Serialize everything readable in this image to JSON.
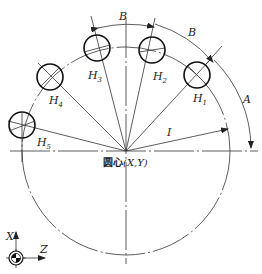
{
  "diagram": {
    "center_label_prefix": "圆心",
    "center_label_coords": "(X,Y)",
    "dimension_labels": {
      "start_angle": "A",
      "increment_angle_1": "B",
      "increment_angle_2": "B",
      "radius": "I"
    },
    "holes": [
      {
        "label": "H",
        "sub": "1"
      },
      {
        "label": "H",
        "sub": "2"
      },
      {
        "label": "H",
        "sub": "3"
      },
      {
        "label": "H",
        "sub": "4"
      },
      {
        "label": "H",
        "sub": "5"
      }
    ],
    "axes": {
      "vertical": "X",
      "horizontal": "Z"
    }
  }
}
